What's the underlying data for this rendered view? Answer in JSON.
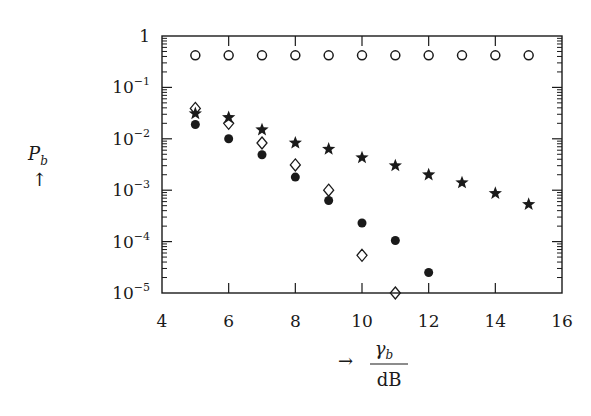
{
  "chart_data": {
    "type": "scatter",
    "title": "",
    "xlabel": "γb / dB",
    "xlabel_numerator": "γ",
    "xlabel_numerator_sub": "b",
    "xlabel_denominator": "dB",
    "xlabel_arrow": "→",
    "ylabel": "Pb",
    "ylabel_main": "P",
    "ylabel_sub": "b",
    "ylabel_arrow": "↑",
    "xlim": [
      4,
      16
    ],
    "ylim": [
      1e-05,
      1
    ],
    "yscale": "log",
    "grid": false,
    "legend": "none",
    "x_ticks": [
      4,
      6,
      8,
      10,
      12,
      14,
      16
    ],
    "x_tick_labels": [
      "4",
      "6",
      "8",
      "10",
      "12",
      "14",
      "16"
    ],
    "y_ticks": [
      1,
      0.1,
      0.01,
      0.001,
      0.0001,
      1e-05
    ],
    "y_tick_labels": [
      {
        "base": "1",
        "exp": ""
      },
      {
        "base": "10",
        "exp": "−1"
      },
      {
        "base": "10",
        "exp": "−2"
      },
      {
        "base": "10",
        "exp": "−3"
      },
      {
        "base": "10",
        "exp": "−4"
      },
      {
        "base": "10",
        "exp": "−5"
      }
    ],
    "series": [
      {
        "name": "open-circle",
        "marker": "circle-open",
        "x": [
          5,
          6,
          7,
          8,
          9,
          10,
          11,
          12,
          13,
          14,
          15
        ],
        "y": [
          0.42,
          0.42,
          0.42,
          0.42,
          0.42,
          0.42,
          0.42,
          0.42,
          0.42,
          0.42,
          0.42
        ]
      },
      {
        "name": "star",
        "marker": "star",
        "x": [
          5,
          6,
          7,
          8,
          9,
          10,
          11,
          12,
          13,
          14,
          15
        ],
        "y": [
          0.031,
          0.026,
          0.015,
          0.0083,
          0.0063,
          0.0043,
          0.003,
          0.002,
          0.0014,
          0.00087,
          0.00053
        ]
      },
      {
        "name": "open-diamond",
        "marker": "diamond-open",
        "x": [
          5,
          6,
          7,
          8,
          9,
          10,
          11
        ],
        "y": [
          0.039,
          0.02,
          0.0083,
          0.0031,
          0.001,
          5.4e-05,
          1e-05
        ]
      },
      {
        "name": "filled-circle",
        "marker": "circle-filled",
        "x": [
          5,
          6,
          7,
          8,
          9,
          10,
          11,
          12
        ],
        "y": [
          0.019,
          0.01,
          0.0049,
          0.0018,
          0.00063,
          0.00023,
          0.000105,
          2.5e-05
        ]
      }
    ]
  }
}
